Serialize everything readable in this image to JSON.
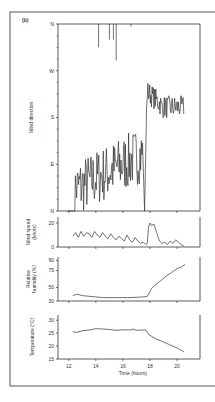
{
  "panel_label": "(b)",
  "chart_data": [
    {
      "type": "line",
      "name": "wind-direction",
      "ylabel": "Wind direction",
      "yticks": [
        "N",
        "E",
        "S",
        "W",
        "N"
      ],
      "ylim": [
        0,
        360
      ],
      "xlim": [
        11.2,
        21.7
      ],
      "x_start": 12.3,
      "x_end": 20.5,
      "values": [
        0,
        0,
        0,
        0,
        0,
        0,
        0,
        0,
        0,
        0,
        0,
        0,
        0,
        0,
        0,
        0,
        0,
        0,
        0,
        0,
        0,
        0,
        0,
        0,
        0,
        0,
        0,
        0,
        0,
        0,
        0,
        0,
        0,
        0,
        0,
        0,
        0,
        0,
        0,
        0,
        0,
        0,
        0,
        0,
        0,
        0,
        0,
        0,
        0,
        0,
        0,
        0,
        0,
        0,
        0,
        0,
        0,
        0,
        0,
        0,
        0,
        0,
        0,
        0,
        0,
        0,
        0,
        0,
        0,
        0,
        0,
        0,
        0,
        0,
        0,
        0,
        0,
        0,
        0,
        0,
        0,
        0,
        0,
        0,
        0,
        0,
        0,
        0,
        0,
        0,
        0,
        0,
        0,
        0,
        0,
        0,
        0,
        0,
        0,
        0,
        0
      ],
      "notes": "noisy series: values generated from description below",
      "description": [
        {
          "from": 12.3,
          "to": 17.5,
          "level_deg": 40,
          "rising_to_deg": 110,
          "noise_deg": 45
        },
        {
          "from": 17.5,
          "to": 17.8,
          "level_deg": 0,
          "jump": true
        },
        {
          "from": 17.8,
          "to": 20.5,
          "level_deg": 200,
          "peak_deg": 245,
          "noise_deg": 20
        }
      ],
      "spikes_at_top": [
        {
          "x": 14.2,
          "deg": 315
        },
        {
          "x": 15.0,
          "deg": 330
        },
        {
          "x": 15.3,
          "deg": 330
        },
        {
          "x": 15.5,
          "deg": 290
        },
        {
          "x": 16.6,
          "deg": 355
        }
      ]
    },
    {
      "type": "line",
      "name": "wind-speed",
      "ylabel": "Wind speed (knots)",
      "yticks": [
        0,
        20
      ],
      "ylim": [
        0,
        25
      ],
      "x": [
        12.3,
        12.5,
        12.7,
        12.9,
        13.1,
        13.3,
        13.5,
        13.7,
        13.9,
        14.1,
        14.3,
        14.5,
        14.7,
        14.9,
        15.1,
        15.3,
        15.5,
        15.7,
        15.9,
        16.1,
        16.3,
        16.5,
        16.7,
        16.9,
        17.1,
        17.3,
        17.5,
        17.7,
        17.8,
        17.9,
        18.0,
        18.1,
        18.3,
        18.5,
        18.7,
        18.9,
        19.1,
        19.3,
        19.5,
        19.7,
        19.9,
        20.1,
        20.3,
        20.5
      ],
      "values": [
        9,
        12,
        8,
        13,
        9,
        12,
        11,
        8,
        13,
        10,
        8,
        12,
        9,
        7,
        11,
        8,
        6,
        9,
        7,
        5,
        10,
        6,
        4,
        8,
        5,
        3,
        4,
        2,
        3,
        17,
        20,
        18,
        19,
        12,
        5,
        3,
        4,
        2,
        5,
        3,
        6,
        4,
        2,
        1
      ]
    },
    {
      "type": "line",
      "name": "relative-humidity",
      "ylabel": "Relative humidity (%)",
      "yticks": [
        30,
        50,
        75,
        90
      ],
      "ylim": [
        30,
        95
      ],
      "x": [
        12.3,
        12.6,
        13.0,
        13.5,
        14.0,
        14.5,
        15.0,
        15.5,
        16.0,
        16.5,
        17.0,
        17.5,
        17.8,
        17.95,
        18.1,
        18.4,
        18.8,
        19.2,
        19.6,
        20.0,
        20.3,
        20.6
      ],
      "values": [
        38,
        40,
        38,
        37,
        36,
        35,
        35,
        35,
        35,
        35,
        35.5,
        36,
        37,
        42,
        48,
        54,
        60,
        67,
        72,
        78,
        80,
        84
      ]
    },
    {
      "type": "line",
      "name": "temperature",
      "ylabel": "Temperature (°C)",
      "yticks": [
        15,
        20,
        25,
        30
      ],
      "ylim": [
        15,
        32
      ],
      "xlabel": "Time (hours)",
      "xticks": [
        12,
        14,
        16,
        18,
        20
      ],
      "x": [
        12.3,
        12.6,
        13.0,
        13.5,
        14.0,
        14.5,
        15.0,
        15.5,
        16.0,
        16.5,
        16.8,
        17.0,
        17.3,
        17.7,
        17.9,
        18.1,
        18.5,
        19.0,
        19.5,
        20.0,
        20.5
      ],
      "values": [
        25.5,
        25.3,
        25.9,
        26.2,
        26.7,
        26.6,
        26.4,
        26.1,
        26.3,
        26.2,
        26.5,
        26.1,
        26.2,
        26.2,
        24.5,
        23.8,
        22.6,
        21.6,
        20.4,
        19.3,
        17.8
      ]
    }
  ]
}
